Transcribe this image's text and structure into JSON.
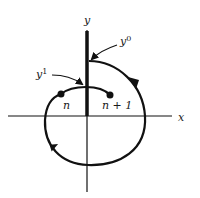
{
  "diagram": {
    "axes": {
      "x_label": "x",
      "y_label": "y"
    },
    "labels": {
      "y0": {
        "base": "y",
        "sup": "0"
      },
      "y1": {
        "base": "y",
        "sup": "1"
      },
      "point_n": "n",
      "point_n1": "n + 1"
    },
    "colors": {
      "stroke": "#111111",
      "background": "#ffffff"
    }
  }
}
